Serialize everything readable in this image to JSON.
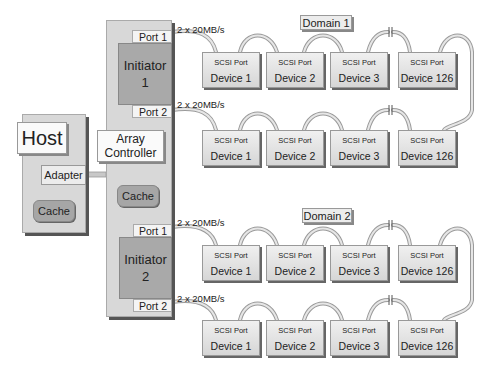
{
  "host": {
    "title": "Host",
    "adapter": "Adapter",
    "cache": "Cache"
  },
  "array": {
    "controller_line1": "Array",
    "controller_line2": "Controller",
    "cache": "Cache",
    "initiators": [
      {
        "line1": "Initiator",
        "line2": "1",
        "port1": "Port 1",
        "port2": "Port 2"
      },
      {
        "line1": "Initiator",
        "line2": "2",
        "port1": "Port 1",
        "port2": "Port 2"
      }
    ]
  },
  "bus_speed": "2 x 20MB/s",
  "domains": [
    {
      "label": "Domain 1",
      "rows": [
        {
          "speed": "2 x 20MB/s",
          "devices": [
            {
              "port": "SCSI Port",
              "name": "Device 1"
            },
            {
              "port": "SCSI Port",
              "name": "Device 2"
            },
            {
              "port": "SCSI Port",
              "name": "Device 3"
            },
            {
              "port": "SCSI Port",
              "name": "Device 126"
            }
          ]
        },
        {
          "speed": "2 x 20MB/s",
          "devices": [
            {
              "port": "SCSI Port",
              "name": "Device 1"
            },
            {
              "port": "SCSI Port",
              "name": "Device 2"
            },
            {
              "port": "SCSI Port",
              "name": "Device 3"
            },
            {
              "port": "SCSI Port",
              "name": "Device 126"
            }
          ]
        }
      ]
    },
    {
      "label": "Domain 2",
      "rows": [
        {
          "speed": "2 x 20MB/s",
          "devices": [
            {
              "port": "SCSI Port",
              "name": "Device 1"
            },
            {
              "port": "SCSI Port",
              "name": "Device 2"
            },
            {
              "port": "SCSI Port",
              "name": "Device 3"
            },
            {
              "port": "SCSI Port",
              "name": "Device 126"
            }
          ]
        },
        {
          "speed": "2 x 20MB/s",
          "devices": [
            {
              "port": "SCSI Port",
              "name": "Device 1"
            },
            {
              "port": "SCSI Port",
              "name": "Device 2"
            },
            {
              "port": "SCSI Port",
              "name": "Device 3"
            },
            {
              "port": "SCSI Port",
              "name": "Device 126"
            }
          ]
        }
      ]
    }
  ],
  "colors": {
    "panel": "#d8d8d8",
    "initiator": "#a9a9a9",
    "cable": "#bdbdbd"
  }
}
